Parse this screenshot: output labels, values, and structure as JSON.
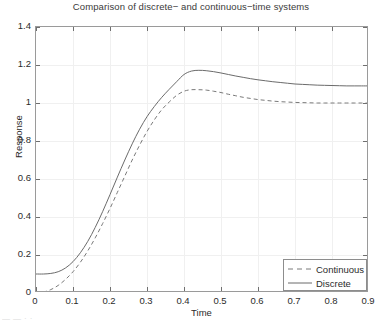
{
  "chart_data": {
    "type": "line",
    "title": "Comparison of discrete− and continuous−time systems",
    "xlabel": "Time",
    "ylabel": "Response",
    "xlim": [
      0,
      0.9
    ],
    "ylim": [
      0,
      1.4
    ],
    "grid": true,
    "legend_position": "lower right",
    "xticks": [
      0,
      0.1,
      0.2,
      0.3,
      0.4,
      0.5,
      0.6,
      0.7,
      0.8,
      0.9
    ],
    "xtick_labels": [
      "0",
      "0.1",
      "0.2",
      "0.3",
      "0.4",
      "0.5",
      "0.6",
      "0.7",
      "0.8",
      "0.9"
    ],
    "yticks": [
      0,
      0.2,
      0.4,
      0.6,
      0.8,
      1.0,
      1.2,
      1.4
    ],
    "ytick_labels": [
      "0",
      "0.2",
      "0.4",
      "0.6",
      "0.8",
      "1",
      "1.2",
      "1.4"
    ],
    "x": [
      0,
      0.02,
      0.04,
      0.06,
      0.08,
      0.1,
      0.12,
      0.14,
      0.16,
      0.18,
      0.2,
      0.22,
      0.24,
      0.26,
      0.28,
      0.3,
      0.32,
      0.34,
      0.36,
      0.38,
      0.4,
      0.42,
      0.44,
      0.46,
      0.48,
      0.5,
      0.52,
      0.54,
      0.56,
      0.58,
      0.6,
      0.62,
      0.64,
      0.66,
      0.68,
      0.7,
      0.72,
      0.74,
      0.76,
      0.78,
      0.8,
      0.82,
      0.84,
      0.86,
      0.88,
      0.9
    ],
    "series": [
      {
        "name": "Continuous",
        "style": "dashed",
        "color": "#7a7a7a",
        "values": [
          0.0,
          0.005,
          0.018,
          0.04,
          0.072,
          0.112,
          0.162,
          0.222,
          0.29,
          0.365,
          0.445,
          0.53,
          0.615,
          0.7,
          0.778,
          0.85,
          0.912,
          0.965,
          1.005,
          1.04,
          1.062,
          1.07,
          1.07,
          1.068,
          1.062,
          1.055,
          1.046,
          1.038,
          1.03,
          1.024,
          1.018,
          1.014,
          1.01,
          1.007,
          1.005,
          1.003,
          1.002,
          1.001,
          1.0,
          1.0,
          1.0,
          1.0,
          1.0,
          1.0,
          1.0,
          1.0
        ]
      },
      {
        "name": "Discrete",
        "style": "solid",
        "color": "#6b6b6b",
        "values": [
          0.1,
          0.1,
          0.103,
          0.112,
          0.132,
          0.165,
          0.212,
          0.272,
          0.345,
          0.428,
          0.518,
          0.61,
          0.7,
          0.785,
          0.862,
          0.928,
          0.982,
          1.03,
          1.072,
          1.112,
          1.15,
          1.168,
          1.172,
          1.17,
          1.165,
          1.158,
          1.15,
          1.142,
          1.135,
          1.128,
          1.122,
          1.117,
          1.112,
          1.108,
          1.104,
          1.1,
          1.098,
          1.096,
          1.094,
          1.093,
          1.092,
          1.091,
          1.09,
          1.09,
          1.09,
          1.09
        ]
      }
    ]
  },
  "legend": {
    "items": [
      {
        "label": "Continuous"
      },
      {
        "label": "Discrete"
      }
    ]
  },
  "artifact": {
    "clipped_caption": "— —  · ·"
  }
}
